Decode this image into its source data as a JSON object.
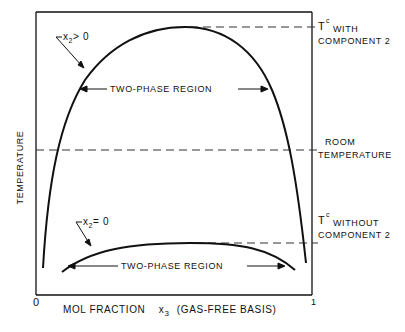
{
  "diagram": {
    "y_axis_label": "TEMPERATURE",
    "x_axis_label": "MOL FRACTION",
    "x_axis_variable": "x",
    "x_axis_variable_sub": "3",
    "x_axis_suffix": "(GAS-FREE BASIS)",
    "x_tick_left": "0",
    "x_tick_right": "1",
    "upper_curve": {
      "label_var": "x",
      "label_sub": "2",
      "label_rel": "> 0",
      "region_label": "TWO-PHASE REGION"
    },
    "lower_curve": {
      "label_var": "x",
      "label_sub": "2",
      "label_rel": "= 0",
      "region_label": "TWO-PHASE REGION"
    },
    "ref_lines": {
      "tc_with": {
        "T": "T",
        "sup": "c",
        "line1": "WITH",
        "line2": "COMPONENT 2"
      },
      "room": {
        "line1": "ROOM",
        "line2": "TEMPERATURE"
      },
      "tc_without": {
        "T": "T",
        "sup": "c",
        "line1": "WITHOUT",
        "line2": "COMPONENT 2"
      }
    }
  }
}
